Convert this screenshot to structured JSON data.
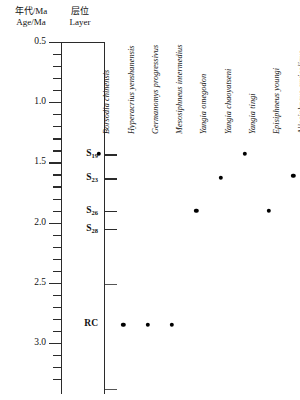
{
  "header": {
    "age_cn": "年代/Ma",
    "age_en": "Age/Ma",
    "layer_cn": "层位",
    "layer_en": "Layer"
  },
  "chart_data": {
    "type": "scatter",
    "title": "",
    "xlabel": "",
    "ylabel": "Age/Ma",
    "ylim": [
      0.5,
      3.3
    ],
    "y_inverted": true,
    "grid": false,
    "legend": "none",
    "axis": {
      "major_ticks": [
        0.5,
        1.0,
        1.5,
        2.0,
        2.5,
        3.0
      ],
      "major_tick_labels": [
        "0.5",
        "1.0",
        "1.5",
        "2.0",
        "2.5",
        "3.0"
      ],
      "minor_tick_interval": 0.1,
      "minor_ticks": [
        0.6,
        0.7,
        0.8,
        0.9,
        1.1,
        1.2,
        1.3,
        1.4,
        1.6,
        1.7,
        1.8,
        1.9,
        2.1,
        2.2,
        2.3,
        2.4,
        2.6,
        2.7,
        2.8,
        2.9,
        3.1,
        3.2,
        3.3
      ]
    },
    "layers": [
      {
        "label": "S",
        "sub": "19",
        "age": 1.43,
        "style": "thick"
      },
      {
        "label": "S",
        "sub": "23",
        "age": 1.63,
        "style": "thick"
      },
      {
        "label": "S",
        "sub": "26",
        "age": 1.9,
        "style": "thick"
      },
      {
        "label": "S",
        "sub": "28",
        "age": 2.05,
        "style": "thick"
      },
      {
        "label": "RC",
        "sub": "",
        "age": 2.51,
        "style": "thin",
        "label_age": 2.84
      },
      {
        "label": "",
        "sub": "",
        "age": 3.38,
        "style": "thin"
      }
    ],
    "categories": [
      "Borsodia chinensis",
      "Hyperacrius yenshanensis",
      "Germanomys progressivus",
      "Mesosiphneus intermedius",
      "Yangia omegodon",
      "Yangia chaoyatseni",
      "Yangia tingi",
      "Episiphneus youngi",
      "Allosiphneus arvicolinus"
    ],
    "points": [
      {
        "taxon": "Borsodia chinensis",
        "age": 1.43
      },
      {
        "taxon": "Hyperacrius yenshanensis",
        "age": 2.85
      },
      {
        "taxon": "Germanomys progressivus",
        "age": 2.85
      },
      {
        "taxon": "Mesosiphneus intermedius",
        "age": 2.85
      },
      {
        "taxon": "Yangia omegodon",
        "age": 1.9
      },
      {
        "taxon": "Yangia chaoyatseni",
        "age": 1.63
      },
      {
        "taxon": "Yangia tingi",
        "age": 1.43
      },
      {
        "taxon": "Episiphneus youngi",
        "age": 1.9
      },
      {
        "taxon": "Allosiphneus arvicolinus",
        "age": 1.61
      }
    ]
  }
}
